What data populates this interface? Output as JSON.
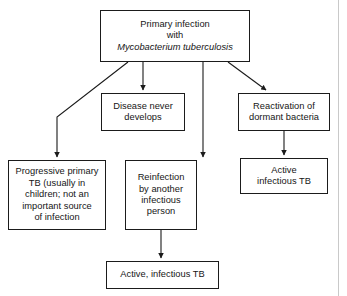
{
  "figure": {
    "background_color": "#ffffff",
    "line_color": "#1b1b1b",
    "text_color": "#161616"
  },
  "nodes": {
    "primary_infection": {
      "line1": "Primary infection",
      "line2": "with",
      "line3_italic": "Mycobacterium tuberculosis"
    },
    "disease_never_develops": {
      "text": "Disease never\ndevelops"
    },
    "reactivation": {
      "text": "Reactivation of\ndormant bacteria"
    },
    "progressive_primary": {
      "text": "Progressive primary\nTB (usually in\nchildren; not an\nimportant source\nof infection"
    },
    "reinfection": {
      "text": "Reinfection\nby another\ninfectious\nperson"
    },
    "active_infectious_tb_right": {
      "text": "Active\ninfectious TB"
    },
    "active_infectious_tb_bottom": {
      "text": "Active, infectious TB"
    }
  },
  "edges": [
    {
      "name": "primary-to-progressive",
      "from": "primary_infection",
      "to": "progressive_primary",
      "style": "elbow-diagonal-then-vertical",
      "arrowhead": true
    },
    {
      "name": "primary-to-disease-never-develops",
      "from": "primary_infection",
      "to": "disease_never_develops",
      "style": "vertical",
      "arrowhead": true
    },
    {
      "name": "primary-to-reinfection",
      "from": "primary_infection",
      "to": "reinfection",
      "style": "vertical-long",
      "arrowhead": true
    },
    {
      "name": "primary-to-reactivation",
      "from": "primary_infection",
      "to": "reactivation",
      "style": "diagonal",
      "arrowhead": true
    },
    {
      "name": "reactivation-to-active-right",
      "from": "reactivation",
      "to": "active_infectious_tb_right",
      "style": "vertical",
      "arrowhead": true
    },
    {
      "name": "reinfection-to-active-bottom",
      "from": "reinfection",
      "to": "active_infectious_tb_bottom",
      "style": "vertical",
      "arrowhead": true
    }
  ]
}
